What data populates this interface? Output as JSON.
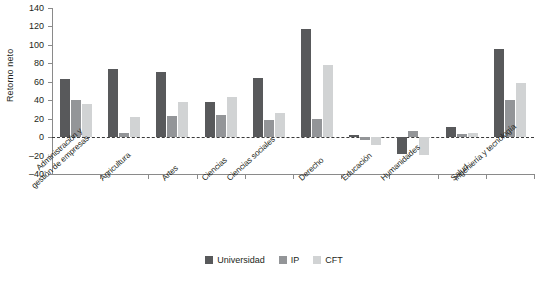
{
  "chart_data": {
    "type": "bar",
    "title": "",
    "xlabel": "",
    "ylabel": "Retorno neto",
    "ylim": [
      -40,
      140
    ],
    "yticks": [
      140,
      120,
      100,
      80,
      60,
      40,
      20,
      0,
      -20,
      -40
    ],
    "grid": false,
    "legend_position": "bottom-center",
    "zero_reference_line": true,
    "categories": [
      "Administración y\ngestión de empresas",
      "Agricultura",
      "Artes",
      "Ciencias",
      "Ciencias sociales",
      "Derecho",
      "Educación",
      "Humanidades",
      "Salud",
      "Ingeniería y tecnología"
    ],
    "series": [
      {
        "name": "Universidad",
        "color": "#58595b",
        "values": [
          63,
          74,
          71,
          38,
          64,
          117,
          2,
          -18,
          11,
          96
        ]
      },
      {
        "name": "IP",
        "color": "#939598",
        "values": [
          40,
          4,
          23,
          24,
          19,
          20,
          -3,
          7,
          3,
          40
        ]
      },
      {
        "name": "CFT",
        "color": "#d1d3d4",
        "values": [
          36,
          22,
          38,
          43,
          26,
          78,
          -9,
          -19,
          5,
          59
        ]
      }
    ]
  },
  "legend": {
    "items": [
      {
        "label": "Universidad",
        "swatch": "u"
      },
      {
        "label": "IP",
        "swatch": "i"
      },
      {
        "label": "CFT",
        "swatch": "c"
      }
    ]
  }
}
